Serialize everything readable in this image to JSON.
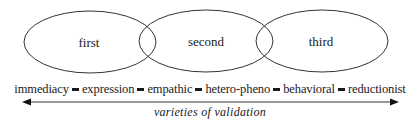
{
  "circles": [
    {
      "label": "first"
    },
    {
      "label": "second"
    },
    {
      "label": "third"
    }
  ],
  "scale": {
    "items": [
      "immediacy",
      "expression",
      "empathic",
      "hetero-pheno",
      "behavioral",
      "reductionist"
    ],
    "separator_glyph": "short-bar"
  },
  "caption": "varieties of validation",
  "colors": {
    "stroke": "#333333",
    "text": "#1a1a1a"
  }
}
